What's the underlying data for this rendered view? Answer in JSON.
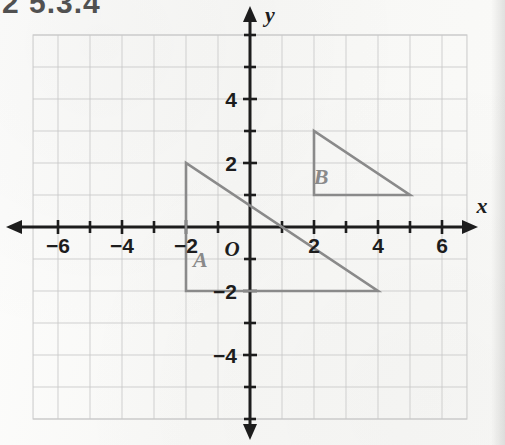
{
  "page": {
    "top_cropped_heading": "2 5.3.4",
    "background_color": "#fbfbfa"
  },
  "figure": {
    "name": "coordinate-plane-two-triangles",
    "axis_label_x": "x",
    "axis_label_y": "y",
    "origin_label": "O",
    "axis_color": "#1d1d1d",
    "grid_color": "#c9c9c9",
    "shape_color": "#8a8a8a"
  },
  "chart_data": {
    "type": "scatter",
    "title": "",
    "subtitle": "",
    "xlabel": "x",
    "ylabel": "y",
    "xlim": [
      -6.8,
      6.8
    ],
    "ylim": [
      -6.0,
      6.0
    ],
    "grid": true,
    "grid_step": 1,
    "legend": "none",
    "origin_label": "O",
    "x_tick_values": [
      -6,
      -4,
      -2,
      2,
      4,
      6
    ],
    "x_tick_labels": [
      "−6",
      "−4",
      "−2",
      "2",
      "4",
      "6"
    ],
    "y_tick_values": [
      4,
      2,
      -2,
      -4
    ],
    "y_tick_labels": [
      "4",
      "2",
      "−2",
      "−4"
    ],
    "minor_tick_values_x": [
      -5,
      -3,
      -1,
      1,
      3,
      5
    ],
    "minor_tick_values_y": [
      5,
      3,
      1,
      -1,
      -3,
      -5
    ],
    "series": [
      {
        "name": "A",
        "type": "polygon",
        "label": "A",
        "label_position": [
          -1.55,
          -1.25
        ],
        "stroke": "#8a8a8a",
        "fill": "none",
        "points": [
          [
            -2,
            2
          ],
          [
            -2,
            -2
          ],
          [
            4,
            -2
          ]
        ],
        "vertices_text": [
          "(-2, 2)",
          "(-2, -2)",
          "(4, -2)"
        ]
      },
      {
        "name": "B",
        "type": "polygon",
        "label": "B",
        "label_position": [
          2.22,
          1.35
        ],
        "stroke": "#8a8a8a",
        "fill": "none",
        "points": [
          [
            2,
            3
          ],
          [
            2,
            1
          ],
          [
            5,
            1
          ]
        ],
        "vertices_text": [
          "(2, 3)",
          "(2, 1)",
          "(5, 1)"
        ]
      }
    ]
  }
}
